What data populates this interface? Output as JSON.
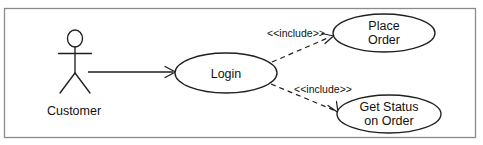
{
  "diagram": {
    "type": "uml-use-case-diagram",
    "title": "",
    "background_color": "#ffffff",
    "frame": {
      "name": "system-boundary-frame",
      "stroke": "#7b7b7b",
      "x": 4,
      "y": 8,
      "width": 472,
      "height": 130
    },
    "stroke_color": "#1f1f1f",
    "text_color": "#111111",
    "actors": [
      {
        "id": "customer",
        "label": "Customer",
        "icon": "stick-figure-actor-icon",
        "x": 75,
        "y": 62,
        "label_x": 74,
        "label_y": 115
      }
    ],
    "use_cases": [
      {
        "id": "login",
        "lines": [
          "Login"
        ],
        "cx": 226,
        "cy": 73,
        "rx": 51,
        "ry": 20
      },
      {
        "id": "place-order",
        "lines": [
          "Place",
          "Order"
        ],
        "cx": 384,
        "cy": 33,
        "rx": 51,
        "ry": 19
      },
      {
        "id": "get-status-on-order",
        "lines": [
          "Get Status",
          "on Order"
        ],
        "cx": 389,
        "cy": 114,
        "rx": 52,
        "ry": 19
      }
    ],
    "associations": [
      {
        "id": "customer-login",
        "from": "customer",
        "to": "login",
        "style": "solid",
        "arrow": "open",
        "label": "",
        "x1": 88,
        "y1": 72,
        "x2": 175,
        "y2": 72
      }
    ],
    "includes": [
      {
        "id": "login-includes-place-order",
        "from": "login",
        "to": "place-order",
        "style": "dashed",
        "arrow": "open",
        "label": "<<include>>",
        "label_x": 296,
        "label_y": 37,
        "x1": 272,
        "y1": 62,
        "x2": 332,
        "y2": 36
      },
      {
        "id": "login-includes-get-status",
        "from": "login",
        "to": "get-status-on-order",
        "style": "dashed",
        "arrow": "open",
        "label": "<<include>>",
        "label_x": 323,
        "label_y": 92,
        "x1": 271,
        "y1": 84,
        "x2": 338,
        "y2": 112
      }
    ]
  }
}
